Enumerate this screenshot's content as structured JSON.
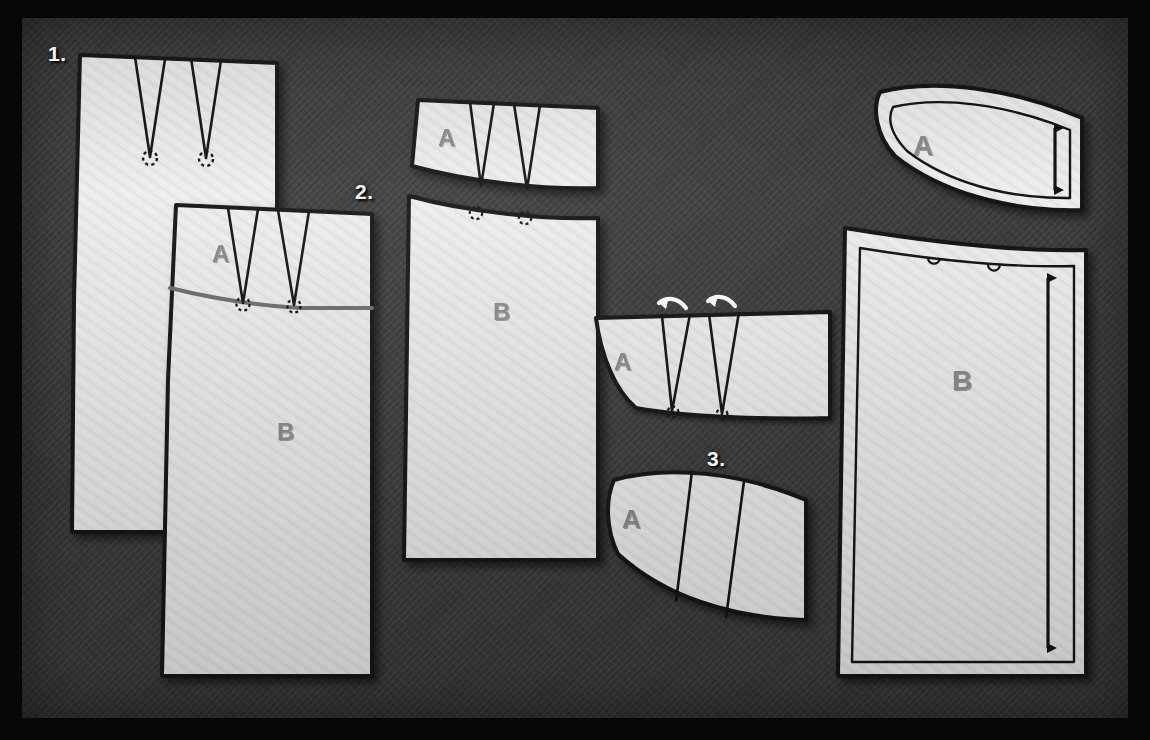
{
  "diagram": {
    "background_color": "#3c3c3c",
    "frame_color": "#070707",
    "paper_color": "#ebebeb",
    "ink_color": "#141414",
    "label_color": "#8c8c8c",
    "guide_color": "#6e6e6e",
    "step_label_color": "#f2f2f2"
  },
  "steps": [
    {
      "id": "step-1",
      "label": "1.",
      "x": 48,
      "y": 42,
      "caption_meaning": "Original skirt front with two waist darts"
    },
    {
      "id": "step-2",
      "label": "2.",
      "x": 355,
      "y": 180,
      "caption_meaning": "Yoke line A drawn across dart points; piece split into A and B"
    },
    {
      "id": "step-3",
      "label": "3.",
      "x": 707,
      "y": 447,
      "caption_meaning": "Darts in yoke A closed by rotation, giving a curved yoke"
    }
  ],
  "pieces": [
    {
      "id": "piece-1-body",
      "label": "",
      "step": 1,
      "kind": "skirt-front-with-darts"
    },
    {
      "id": "piece-2-yoke",
      "label": "A",
      "step": 2,
      "kind": "yoke-section"
    },
    {
      "id": "piece-2-body",
      "label": "B",
      "step": 2,
      "kind": "lower-skirt-section"
    },
    {
      "id": "piece-2b-yoke",
      "label": "A",
      "step": 2,
      "kind": "yoke-separated"
    },
    {
      "id": "piece-2b-body",
      "label": "B",
      "step": 2,
      "kind": "lower-skirt-separated"
    },
    {
      "id": "piece-3-yoke-rotating",
      "label": "A",
      "step": 3,
      "kind": "yoke-darts-rotating"
    },
    {
      "id": "piece-3-yoke-closed",
      "label": "A",
      "step": 3,
      "kind": "yoke-darts-closed"
    },
    {
      "id": "piece-final-yoke",
      "label": "A",
      "step": 3,
      "kind": "final-yoke-with-seam-allowance"
    },
    {
      "id": "piece-final-body",
      "label": "B",
      "step": 3,
      "kind": "final-skirt-with-seam-allowance"
    }
  ],
  "markings": {
    "dart_apex": "dashed-circle",
    "rotation_arrow": "curved-arrow-white",
    "grainline": "double-headed-arrow",
    "dart_notch": "small-u-notch",
    "yoke_line": "gray-curve"
  },
  "labels": {
    "yoke": "A",
    "body": "B"
  },
  "grainlines": [
    {
      "on": "piece-final-yoke",
      "orientation": "vertical",
      "marker": "double-headed-arrow"
    },
    {
      "on": "piece-final-body",
      "orientation": "vertical",
      "marker": "double-headed-arrow"
    }
  ]
}
